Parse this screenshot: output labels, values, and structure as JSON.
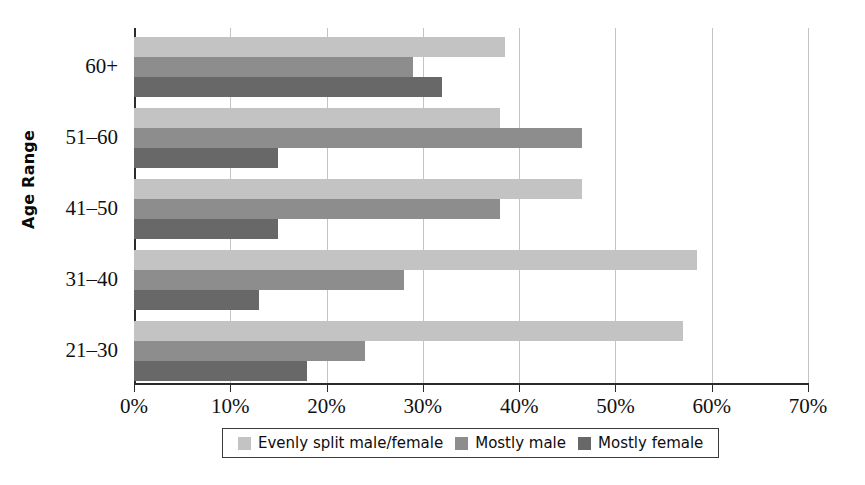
{
  "chart_data": {
    "type": "bar",
    "orientation": "horizontal",
    "title": "",
    "xlabel": "",
    "ylabel": "Age Range",
    "categories": [
      "21–30",
      "31–40",
      "41–50",
      "51–60",
      "60+"
    ],
    "series": [
      {
        "name": "Evenly split male/female",
        "color": "#c3c3c3",
        "values": [
          57,
          58.5,
          46.5,
          38,
          38.5
        ]
      },
      {
        "name": "Mostly male",
        "color": "#8d8d8d",
        "values": [
          24,
          28,
          38,
          46.5,
          29
        ]
      },
      {
        "name": "Mostly female",
        "color": "#686868",
        "values": [
          18,
          13,
          15,
          15,
          32
        ]
      }
    ],
    "xlim": [
      0,
      70
    ],
    "xticks": [
      0,
      10,
      20,
      30,
      40,
      50,
      60,
      70
    ],
    "xtick_labels": [
      "0%",
      "10%",
      "20%",
      "30%",
      "40%",
      "50%",
      "60%",
      "70%"
    ],
    "grid": "vertical",
    "legend_position": "bottom",
    "value_suffix": "%"
  },
  "legend": {
    "items": [
      {
        "label": "Evenly split male/female",
        "color": "#c3c3c3",
        "icon": "legend-swatch-icon"
      },
      {
        "label": "Mostly male",
        "color": "#8d8d8d",
        "icon": "legend-swatch-icon"
      },
      {
        "label": "Mostly female",
        "color": "#686868",
        "icon": "legend-swatch-icon"
      }
    ]
  }
}
